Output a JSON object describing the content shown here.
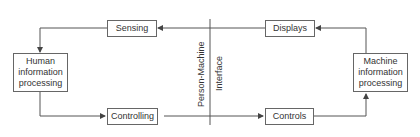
{
  "diagram": {
    "boxes": {
      "sensing": "Sensing",
      "displays": "Displays",
      "human": "Human information processing",
      "machine": "Machine information processing",
      "controlling": "Controlling",
      "controls": "Controls"
    },
    "interface_labels": {
      "left": "Person-Machine",
      "right": "Interface"
    },
    "colors": {
      "line": "#555555",
      "box_border": "#666666",
      "text": "#333333"
    }
  }
}
